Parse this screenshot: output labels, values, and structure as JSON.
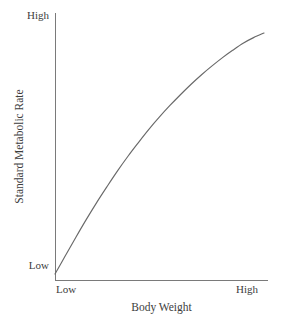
{
  "figure": {
    "background_color": "#ffffff",
    "axis_color": "#7a7a7a",
    "curve_color": "#696969",
    "text_color": "#3d3d3d"
  },
  "axes": {
    "y": {
      "title": "Standard Metabolic Rate",
      "tick_high": "High",
      "tick_low": "Low"
    },
    "x": {
      "title": "Body Weight",
      "tick_low": "Low",
      "tick_high": "High"
    }
  },
  "chart_data": {
    "type": "line",
    "title": "",
    "subtitle": "",
    "xlabel": "Body Weight",
    "ylabel": "Standard Metabolic Rate",
    "xlim": [
      0,
      1
    ],
    "ylim": [
      0,
      1
    ],
    "x_tick_labels": [
      "Low",
      "High"
    ],
    "y_tick_labels": [
      "Low",
      "High"
    ],
    "x_tick_positions": [
      0,
      1
    ],
    "y_tick_positions": [
      0,
      1
    ],
    "grid": false,
    "legend": null,
    "annotations": [],
    "series": [
      {
        "name": "Standard metabolic rate vs body weight",
        "shape": "concave-down increasing (decelerating / allometric)",
        "x": [
          0.0,
          0.05,
          0.1,
          0.15,
          0.2,
          0.25,
          0.3,
          0.35,
          0.4,
          0.45,
          0.5,
          0.55,
          0.6,
          0.65,
          0.7,
          0.75,
          0.8,
          0.85,
          0.9,
          0.95,
          1.0
        ],
        "y": [
          0.012,
          0.088,
          0.163,
          0.236,
          0.306,
          0.372,
          0.436,
          0.496,
          0.552,
          0.606,
          0.656,
          0.703,
          0.747,
          0.789,
          0.828,
          0.864,
          0.898,
          0.929,
          0.958,
          0.981,
          1.0
        ]
      }
    ]
  }
}
